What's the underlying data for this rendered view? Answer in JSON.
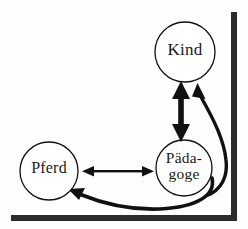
{
  "figure": {
    "type": "relationship-diagram",
    "background_color": "#fefefe",
    "stroke_color": "#111111",
    "border_color": "#2b2b2b"
  },
  "nodes": [
    {
      "id": "kind",
      "label": "Kind",
      "label_lines": [
        "Kind"
      ],
      "cx": 185,
      "cy": 52,
      "r": 30,
      "shape": "circle"
    },
    {
      "id": "paedagoge",
      "label": "Pädagoge",
      "label_lines": [
        "Päda-",
        "goge"
      ],
      "cx": 184,
      "cy": 168,
      "r": 28,
      "shape": "circle"
    },
    {
      "id": "pferd",
      "label": "Pferd",
      "label_lines": [
        "Pferd"
      ],
      "cx": 49,
      "cy": 171,
      "r": 29,
      "shape": "circle"
    }
  ],
  "edges": [
    {
      "id": "kind-paedagoge",
      "from": "kind",
      "to": "paedagoge",
      "style": "thick-double-arrow",
      "direction": "bidirectional",
      "orientation": "vertical"
    },
    {
      "id": "pferd-paedagoge",
      "from": "pferd",
      "to": "paedagoge",
      "style": "thin-double-arrow",
      "direction": "bidirectional",
      "orientation": "horizontal"
    },
    {
      "id": "paedagoge-pferd-curve",
      "from": "paedagoge",
      "to": "pferd",
      "style": "thick-curved-arrow",
      "direction": "unidirectional",
      "orientation": "curve-bottom"
    },
    {
      "id": "paedagoge-kind-curve",
      "from": "paedagoge",
      "to": "kind",
      "style": "thick-curved-arrow",
      "direction": "unidirectional",
      "orientation": "curve-right"
    }
  ],
  "frame": {
    "right_bar": {
      "x": 231,
      "y": 12,
      "width": 6,
      "height": 207
    },
    "bottom_bar": {
      "x": 11,
      "y": 215,
      "width": 226,
      "height": 6
    }
  }
}
